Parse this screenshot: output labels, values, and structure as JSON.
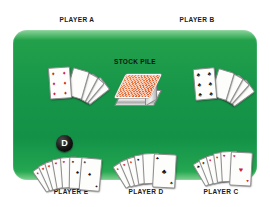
{
  "scene": {
    "title": "card-game-table",
    "table_color": "#139247",
    "table_edge_color": "#46ba5f",
    "background_color": "#ffffff"
  },
  "labels": {
    "player_a": "PLAYER A",
    "player_b": "PLAYER B",
    "player_c": "PLAYER C",
    "player_d": "PLAYER D",
    "player_e": "PLAYER E",
    "stock_pile": "STOCK PILE"
  },
  "dealer_button": {
    "letter": "D",
    "color": "#000000",
    "text_color": "#ffffff",
    "at_player": "PLAYER E"
  },
  "stock_pile": {
    "label": "STOCK PILE",
    "card_back_color": "#e8703a",
    "face_down": true
  },
  "hands": [
    {
      "player": "PLAYER A",
      "position": "top-left",
      "card_count": 5,
      "front_card": {
        "rank": "6",
        "suit": "diamonds",
        "color": "#d0202a",
        "pip": "♦"
      },
      "fan_direction": "right",
      "cards": [
        {
          "rank": "6",
          "suit": "diamonds",
          "pip": "♦",
          "color": "red"
        },
        {
          "rank": "A",
          "suit": "diamonds",
          "pip": "♦",
          "color": "red"
        },
        {
          "rank": "K",
          "suit": "clubs",
          "pip": "♣",
          "color": "black"
        },
        {
          "rank": "Q",
          "suit": "clubs",
          "pip": "♣",
          "color": "black"
        },
        {
          "rank": "J",
          "suit": "clubs",
          "pip": "♣",
          "color": "black"
        }
      ]
    },
    {
      "player": "PLAYER B",
      "position": "top-right",
      "card_count": 5,
      "front_card": {
        "rank": "6",
        "suit": "clubs",
        "color": "#111111",
        "pip": "♣"
      },
      "fan_direction": "right",
      "cards": [
        {
          "rank": "6",
          "suit": "clubs",
          "pip": "♣",
          "color": "black"
        },
        {
          "rank": "A",
          "suit": "clubs",
          "pip": "♣",
          "color": "black"
        },
        {
          "rank": "K",
          "suit": "hearts",
          "pip": "♥",
          "color": "red"
        },
        {
          "rank": "Q",
          "suit": "diamonds",
          "pip": "♦",
          "color": "red"
        },
        {
          "rank": "J",
          "suit": "spades",
          "pip": "♠",
          "color": "black"
        }
      ]
    },
    {
      "player": "PLAYER C",
      "position": "bottom-right",
      "card_count": 6,
      "front_card": {
        "rank": "A",
        "suit": "hearts",
        "color": "#d0202a",
        "pip": "♥"
      },
      "fan_direction": "left",
      "cards": [
        {
          "rank": "A",
          "suit": "hearts",
          "pip": "♥",
          "color": "red"
        },
        {
          "rank": "K",
          "suit": "hearts",
          "pip": "♥",
          "color": "red"
        },
        {
          "rank": "Q",
          "suit": "diamonds",
          "pip": "♦",
          "color": "red"
        },
        {
          "rank": "J",
          "suit": "diamonds",
          "pip": "♦",
          "color": "red"
        },
        {
          "rank": "10",
          "suit": "spades",
          "pip": "♠",
          "color": "black"
        },
        {
          "rank": "9",
          "suit": "clubs",
          "pip": "♣",
          "color": "black"
        }
      ]
    },
    {
      "player": "PLAYER D",
      "position": "bottom-center",
      "card_count": 6,
      "front_card": {
        "rank": "A",
        "suit": "clubs",
        "color": "#111111",
        "pip": "♣"
      },
      "fan_direction": "left",
      "cards": [
        {
          "rank": "A",
          "suit": "clubs",
          "pip": "♣",
          "color": "black"
        },
        {
          "rank": "K",
          "suit": "spades",
          "pip": "♠",
          "color": "black"
        },
        {
          "rank": "Q",
          "suit": "hearts",
          "pip": "♥",
          "color": "red"
        },
        {
          "rank": "J",
          "suit": "diamonds",
          "pip": "♦",
          "color": "red"
        },
        {
          "rank": "10",
          "suit": "hearts",
          "pip": "♥",
          "color": "red"
        },
        {
          "rank": "9",
          "suit": "diamonds",
          "pip": "♦",
          "color": "red"
        }
      ]
    },
    {
      "player": "PLAYER E",
      "position": "bottom-left",
      "card_count": 7,
      "front_card": {
        "rank": "A",
        "suit": "spades",
        "color": "#111111",
        "pip": "♠"
      },
      "fan_direction": "left",
      "cards": [
        {
          "rank": "A",
          "suit": "spades",
          "pip": "♠",
          "color": "black"
        },
        {
          "rank": "K",
          "suit": "spades",
          "pip": "♠",
          "color": "black"
        },
        {
          "rank": "Q",
          "suit": "hearts",
          "pip": "♥",
          "color": "red"
        },
        {
          "rank": "J",
          "suit": "hearts",
          "pip": "♥",
          "color": "red"
        },
        {
          "rank": "10",
          "suit": "diamonds",
          "pip": "♦",
          "color": "red"
        },
        {
          "rank": "9",
          "suit": "diamonds",
          "pip": "♦",
          "color": "red"
        },
        {
          "rank": "8",
          "suit": "hearts",
          "pip": "♥",
          "color": "red"
        }
      ]
    }
  ]
}
